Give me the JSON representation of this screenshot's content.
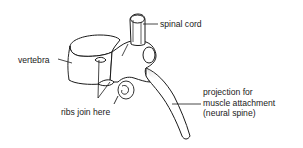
{
  "diagram": {
    "subject": "vertebra",
    "colors": {
      "ink": "#1a1a1a",
      "background": "#ffffff",
      "shade": "#8a8a8a"
    },
    "labels": {
      "spinal_cord": "spinal cord",
      "vertebra": "vertebra",
      "ribs": "ribs join here",
      "projection": {
        "line1": "projection for",
        "line2": "muscle attachment",
        "line3": "(neural spine)"
      }
    }
  }
}
